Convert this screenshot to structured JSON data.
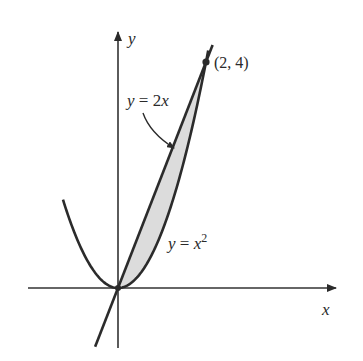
{
  "figure": {
    "axes": {
      "x_label": "x",
      "y_label": "y"
    },
    "curves": [
      {
        "id": "line",
        "label_prefix": "y = 2",
        "label_var": "x",
        "equation": "y = 2x"
      },
      {
        "id": "parabola",
        "label_prefix": "y = ",
        "label_var": "x",
        "label_exp": "2",
        "equation": "y = x^2"
      }
    ],
    "intersection_point": {
      "label": "(2, 4)",
      "x": 2,
      "y": 4
    },
    "shaded_region": {
      "between": [
        "y = 2x",
        "y = x^2"
      ],
      "x_from": 0,
      "x_to": 2,
      "fill": "#d9d9d9"
    },
    "colors": {
      "stroke": "#2b2b2b",
      "axis": "#333333",
      "shade": "#dcdcdc"
    }
  }
}
